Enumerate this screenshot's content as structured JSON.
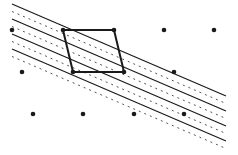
{
  "diagram": {
    "colors": {
      "background": "#ffffff",
      "ink": "#1a1a1a"
    },
    "lattice_points": [
      {
        "x": 12,
        "y": 30
      },
      {
        "x": 63,
        "y": 30
      },
      {
        "x": 114,
        "y": 30
      },
      {
        "x": 164,
        "y": 30
      },
      {
        "x": 214,
        "y": 30
      },
      {
        "x": 22,
        "y": 72
      },
      {
        "x": 73,
        "y": 72
      },
      {
        "x": 124,
        "y": 72
      },
      {
        "x": 174,
        "y": 72
      },
      {
        "x": 33,
        "y": 114
      },
      {
        "x": 83,
        "y": 114
      },
      {
        "x": 134,
        "y": 114
      },
      {
        "x": 184,
        "y": 114
      }
    ],
    "parallelogram": [
      {
        "x": 63,
        "y": 30
      },
      {
        "x": 114,
        "y": 30
      },
      {
        "x": 124,
        "y": 72
      },
      {
        "x": 73,
        "y": 72
      }
    ],
    "solid_lines": [
      {
        "x1": 12,
        "y1": 4,
        "x2": 226,
        "y2": 96
      },
      {
        "x1": 12,
        "y1": 19,
        "x2": 226,
        "y2": 111
      },
      {
        "x1": 12,
        "y1": 34,
        "x2": 226,
        "y2": 126
      },
      {
        "x1": 12,
        "y1": 49,
        "x2": 226,
        "y2": 141
      }
    ],
    "dashed_lines": [
      {
        "x1": 12,
        "y1": 11.5,
        "x2": 226,
        "y2": 103.5
      },
      {
        "x1": 12,
        "y1": 26.5,
        "x2": 226,
        "y2": 118.5
      },
      {
        "x1": 12,
        "y1": 41.5,
        "x2": 226,
        "y2": 133.5
      },
      {
        "x1": 12,
        "y1": 56.5,
        "x2": 226,
        "y2": 148.5
      }
    ]
  }
}
